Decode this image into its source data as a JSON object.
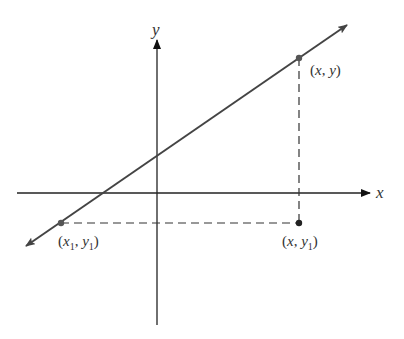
{
  "axes": {
    "x_label": "x",
    "y_label": "y",
    "origin_px": [
      157,
      193
    ]
  },
  "line": {
    "description": "straight line with arrows at both ends, positive slope",
    "color": "#444444"
  },
  "points": [
    {
      "id": "p1",
      "label": "(x1, y1)",
      "label_parts": {
        "open": "(",
        "a": "x",
        "a_sub": "1",
        "sep": ", ",
        "b": "y",
        "b_sub": "1",
        "close": ")"
      },
      "px": [
        61,
        223
      ]
    },
    {
      "id": "p2",
      "label": "(x, y)",
      "label_parts": {
        "open": "(",
        "a": "x",
        "sep": ", ",
        "b": "y",
        "close": ")"
      },
      "px": [
        299,
        58
      ]
    },
    {
      "id": "p3",
      "label": "(x, y1)",
      "label_parts": {
        "open": "(",
        "a": "x",
        "sep": ", ",
        "b": "y",
        "b_sub": "1",
        "close": ")"
      },
      "px": [
        299,
        223
      ]
    }
  ],
  "dashed_segments": [
    {
      "from": "p1",
      "to": "p3",
      "orientation": "horizontal"
    },
    {
      "from": "p2",
      "to": "p3",
      "orientation": "vertical"
    }
  ],
  "colors": {
    "stroke": "#222222",
    "line": "#444444",
    "point": "#333333"
  }
}
